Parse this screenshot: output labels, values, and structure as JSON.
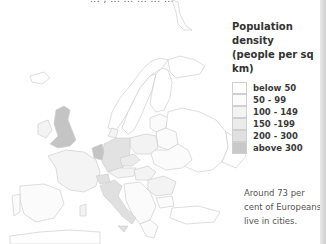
{
  "header": {
    "clipped_text": "... , ... ... ... ... ..."
  },
  "legend": {
    "title_line1": "Population density",
    "title_line2": "(people per sq km)",
    "items": [
      {
        "label": "below 50",
        "color": "#ffffff"
      },
      {
        "label": "50 - 99",
        "color": "#fbfbfb"
      },
      {
        "label": "100 - 149",
        "color": "#f3f3f3"
      },
      {
        "label": "150 -199",
        "color": "#ebebeb"
      },
      {
        "label": "200 - 300",
        "color": "#e0e0e0"
      },
      {
        "label": "above 300",
        "color": "#c8c8c8"
      }
    ]
  },
  "note": {
    "text": "Around 73 per cent of Europeans live in cities."
  },
  "map": {
    "region": "Europe",
    "shaded_high": [
      "United Kingdom",
      "Netherlands",
      "Belgium"
    ],
    "shaded_mid": [
      "Germany",
      "Italy",
      "Switzerland"
    ],
    "colors": {
      "border": "#cfcfcf",
      "high": "#c4c4c4",
      "mid": "#e2e2e2",
      "low": "#f4f4f4",
      "lowest": "#ffffff"
    }
  }
}
